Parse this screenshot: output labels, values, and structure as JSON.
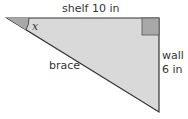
{
  "diagram": {
    "type": "right-triangle",
    "colors": {
      "fill": "#d9d9d9",
      "stroke": "#333333",
      "marker": "#a8a8a8"
    },
    "labels": {
      "shelf": "shelf  10 in",
      "brace": "brace",
      "wall_name": "wall",
      "wall_length": "6 in",
      "angle": "x"
    },
    "sides": [
      {
        "name": "shelf",
        "length": "10 in",
        "position": "top"
      },
      {
        "name": "wall",
        "length": "6 in",
        "position": "right"
      },
      {
        "name": "brace",
        "length": null,
        "position": "hypotenuse"
      }
    ]
  }
}
